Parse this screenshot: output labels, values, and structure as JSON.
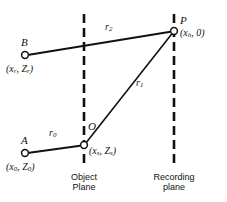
{
  "figure": {
    "background": "#ffffff",
    "stroke_color": "#111111",
    "width": 227,
    "height": 202
  },
  "points": [
    {
      "id": "B",
      "name": "B",
      "coord_open": "(",
      "coord_x": "x",
      "coord_x_sub": "r",
      "coord_sep": ", ",
      "coord_z": "Z",
      "coord_z_sub": "r",
      "coord_close": ")",
      "coord_text": "(x_r, Z_r)",
      "cx": 25,
      "cy": 55
    },
    {
      "id": "A",
      "name": "A",
      "coord_open": "(",
      "coord_x": "x",
      "coord_x_sub": "0",
      "coord_sep": ", ",
      "coord_z": "Z",
      "coord_z_sub": "0",
      "coord_close": ")",
      "coord_text": "(x_0, Z_0)",
      "cx": 25,
      "cy": 153
    },
    {
      "id": "O",
      "name": "O",
      "coord_open": "(",
      "coord_x": "x",
      "coord_x_sub": "s",
      "coord_sep": ", ",
      "coord_z": "Z",
      "coord_z_sub": "s",
      "coord_close": ")",
      "coord_text": "(x_s, Z_s)",
      "cx": 84,
      "cy": 145
    },
    {
      "id": "P",
      "name": "P",
      "coord_open": "(",
      "coord_x": "x",
      "coord_x_sub": "h",
      "coord_sep": ", ",
      "coord_z": "0",
      "coord_z_sub": "",
      "coord_close": ")",
      "coord_text": "(x_h, 0)",
      "cx": 174,
      "cy": 31
    }
  ],
  "rays": [
    {
      "id": "r0",
      "symbol": "r",
      "subscript": "0",
      "from": "A",
      "to": "O",
      "label_x": 49,
      "label_y": 135
    },
    {
      "id": "r1",
      "symbol": "r",
      "subscript": "1",
      "from": "O",
      "to": "P",
      "label_x": 136,
      "label_y": 84
    },
    {
      "id": "r2",
      "symbol": "r",
      "subscript": "2",
      "from": "B",
      "to": "P",
      "label_x": 105,
      "label_y": 28
    }
  ],
  "planes": [
    {
      "id": "object-plane",
      "line1": "Object",
      "line2": "Plane",
      "x": 84,
      "label_cx": 84,
      "label_y": 174
    },
    {
      "id": "recording-plane",
      "line1": "Recording",
      "line2": "plane",
      "x": 174,
      "label_cx": 174,
      "label_y": 174
    }
  ]
}
